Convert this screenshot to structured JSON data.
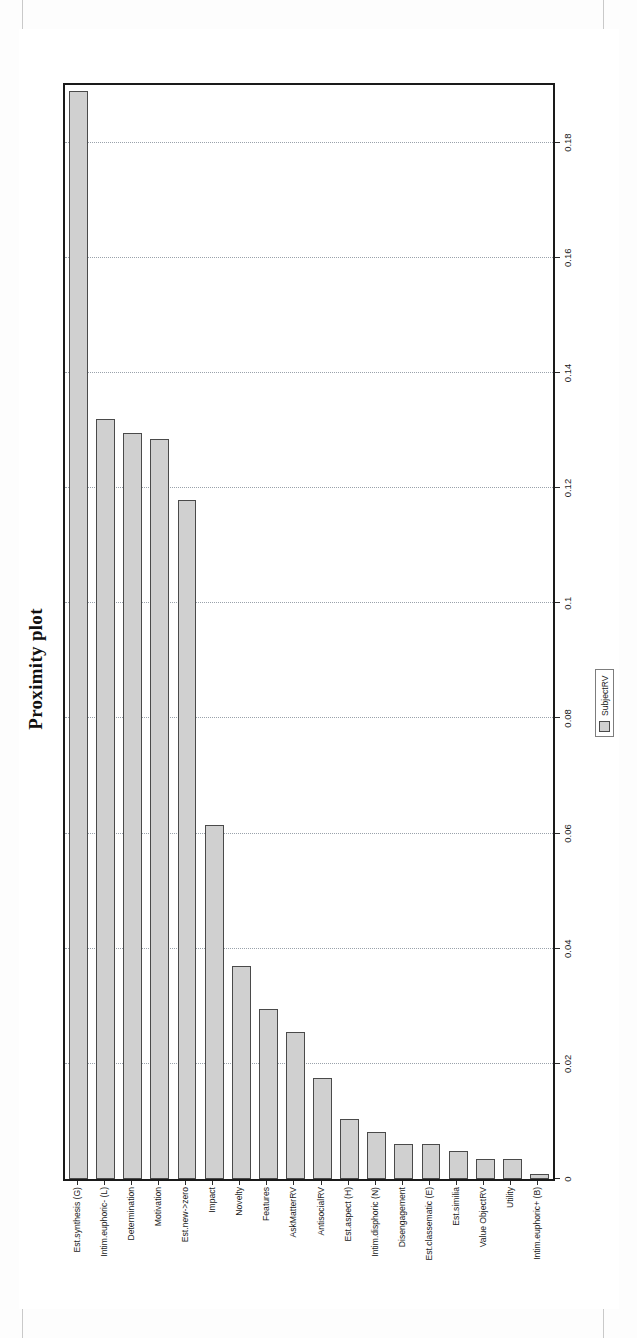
{
  "figure": {
    "title": "Proximity plot",
    "legend": {
      "swatch_name": "series-swatch",
      "entries": [
        "SubjectRV"
      ]
    }
  },
  "chart_data": {
    "type": "bar",
    "title": "Proximity plot",
    "orientation": "vertical-rotated-90ccw",
    "xlabel": "",
    "ylabel": "",
    "ylim": [
      0,
      0.19
    ],
    "grid": true,
    "legend_position": "bottom-right",
    "legend": [
      "SubjectRV"
    ],
    "tick_labels": [
      "0",
      "0.02",
      "0.04",
      "0.06",
      "0.08",
      "0.1",
      "0.12",
      "0.14",
      "0.16",
      "0.18"
    ],
    "ticks": [
      0,
      0.02,
      0.04,
      0.06,
      0.08,
      0.1,
      0.12,
      0.14,
      0.16,
      0.18
    ],
    "categories": [
      "Est.synthesis (G)",
      "Intim.euphoric- (L)",
      "Determination",
      "Motivation",
      "Est.new->zero",
      "Impact",
      "Novelty",
      "Features",
      "AskMatterRV",
      "AntisocialRV",
      "Est.aspect (H)",
      "Intim.disphoric (N)",
      "Disengagement",
      "Est.classematic (E)",
      "Est.similia",
      "Value ObjectRV",
      "Utility",
      "Intim.euphoric+ (B)"
    ],
    "series": [
      {
        "name": "SubjectRV",
        "values": [
          0.189,
          0.132,
          0.1295,
          0.1285,
          0.118,
          0.0615,
          0.037,
          0.0295,
          0.0255,
          0.0175,
          0.0105,
          0.0082,
          0.006,
          0.006,
          0.0048,
          0.0035,
          0.0035,
          0.0008
        ]
      }
    ]
  }
}
